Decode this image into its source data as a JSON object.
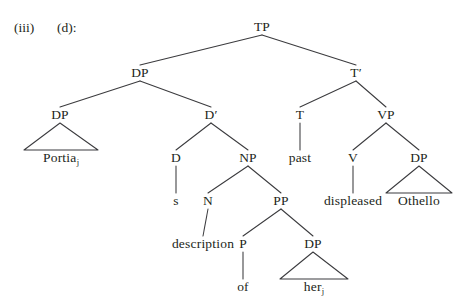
{
  "figure": {
    "item_number": "(iii)",
    "item_letter": "(d):",
    "type": "syntax-tree",
    "ink_color": "#3b3b3e",
    "text_color": "#231f20"
  },
  "tree": {
    "nodes": [
      {
        "id": "TP",
        "label": "TP",
        "sub": "",
        "x": 262,
        "y": 27,
        "kind": "nonterminal"
      },
      {
        "id": "DP1",
        "label": "DP",
        "sub": "",
        "x": 140,
        "y": 73,
        "kind": "nonterminal"
      },
      {
        "id": "Tbar",
        "label": "T′",
        "sub": "",
        "x": 356,
        "y": 73,
        "kind": "nonterminal"
      },
      {
        "id": "DP2",
        "label": "DP",
        "sub": "",
        "x": 60,
        "y": 115,
        "kind": "nonterminal"
      },
      {
        "id": "Dbar",
        "label": "D′",
        "sub": "",
        "x": 211,
        "y": 115,
        "kind": "nonterminal"
      },
      {
        "id": "T",
        "label": "T",
        "sub": "",
        "x": 300,
        "y": 115,
        "kind": "nonterminal"
      },
      {
        "id": "VP",
        "label": "VP",
        "sub": "",
        "x": 386,
        "y": 115,
        "kind": "nonterminal"
      },
      {
        "id": "Portia",
        "label": "Portia",
        "sub": "j",
        "x": 61,
        "y": 158,
        "kind": "terminal"
      },
      {
        "id": "D",
        "label": "D",
        "sub": "",
        "x": 176,
        "y": 158,
        "kind": "nonterminal"
      },
      {
        "id": "NP",
        "label": "NP",
        "sub": "",
        "x": 248,
        "y": 158,
        "kind": "nonterminal"
      },
      {
        "id": "past",
        "label": "past",
        "sub": "",
        "x": 300,
        "y": 158,
        "kind": "terminal"
      },
      {
        "id": "V",
        "label": "V",
        "sub": "",
        "x": 353,
        "y": 158,
        "kind": "nonterminal"
      },
      {
        "id": "DP3",
        "label": "DP",
        "sub": "",
        "x": 419,
        "y": 158,
        "kind": "nonterminal"
      },
      {
        "id": "s",
        "label": "s",
        "sub": "",
        "x": 176,
        "y": 201,
        "kind": "terminal"
      },
      {
        "id": "N",
        "label": "N",
        "sub": "",
        "x": 208,
        "y": 201,
        "kind": "nonterminal"
      },
      {
        "id": "PP",
        "label": "PP",
        "sub": "",
        "x": 281,
        "y": 201,
        "kind": "nonterminal"
      },
      {
        "id": "displeased",
        "label": "displeased",
        "sub": "",
        "x": 353,
        "y": 201,
        "kind": "terminal"
      },
      {
        "id": "Othello",
        "label": "Othello",
        "sub": "",
        "x": 419,
        "y": 201,
        "kind": "terminal"
      },
      {
        "id": "description",
        "label": "description",
        "sub": "",
        "x": 203,
        "y": 244,
        "kind": "terminal"
      },
      {
        "id": "P",
        "label": "P",
        "sub": "",
        "x": 243,
        "y": 244,
        "kind": "nonterminal"
      },
      {
        "id": "DP4",
        "label": "DP",
        "sub": "",
        "x": 313,
        "y": 244,
        "kind": "nonterminal"
      },
      {
        "id": "of",
        "label": "of",
        "sub": "",
        "x": 243,
        "y": 287,
        "kind": "terminal"
      },
      {
        "id": "her",
        "label": "her",
        "sub": "j",
        "x": 314,
        "y": 287,
        "kind": "terminal"
      }
    ],
    "edges": [
      {
        "from": "TP",
        "to": "DP1"
      },
      {
        "from": "TP",
        "to": "Tbar"
      },
      {
        "from": "DP1",
        "to": "DP2"
      },
      {
        "from": "DP1",
        "to": "Dbar"
      },
      {
        "from": "Tbar",
        "to": "T"
      },
      {
        "from": "Tbar",
        "to": "VP"
      },
      {
        "from": "Dbar",
        "to": "D"
      },
      {
        "from": "Dbar",
        "to": "NP"
      },
      {
        "from": "T",
        "to": "past"
      },
      {
        "from": "VP",
        "to": "V"
      },
      {
        "from": "VP",
        "to": "DP3"
      },
      {
        "from": "D",
        "to": "s"
      },
      {
        "from": "NP",
        "to": "N"
      },
      {
        "from": "NP",
        "to": "PP"
      },
      {
        "from": "V",
        "to": "displeased"
      },
      {
        "from": "N",
        "to": "description"
      },
      {
        "from": "PP",
        "to": "P"
      },
      {
        "from": "PP",
        "to": "DP4"
      },
      {
        "from": "P",
        "to": "of"
      },
      {
        "from": "DP4",
        "to": "her"
      }
    ],
    "triangles": [
      {
        "from": "DP2",
        "to": "Portia",
        "half_width": 37
      },
      {
        "from": "DP3",
        "to": "Othello",
        "half_width": 33
      },
      {
        "from": "DP4",
        "to": "her",
        "half_width": 34
      }
    ]
  }
}
